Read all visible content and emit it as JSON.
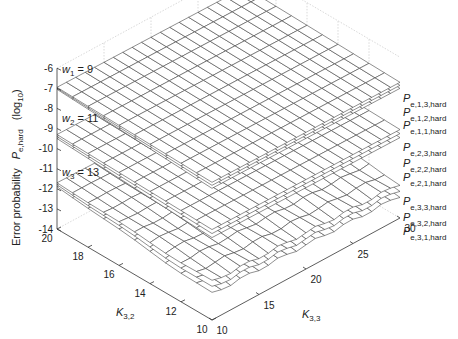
{
  "chart_data": {
    "type": "surface3d",
    "title": "",
    "xlabel": "K_{3,3}",
    "ylabel": "K_{3,2}",
    "zlabel": "Error probability P_{e,hard} (log10)",
    "zlabel_parts": {
      "main": "Error probability",
      "sym": "P",
      "sub": "e,hard",
      "unit": "(log",
      "unit_sub": "10",
      "unit_close": ")"
    },
    "x_axis": {
      "name": "K3,3",
      "range": [
        10,
        30
      ],
      "ticks": [
        10,
        15,
        20,
        25,
        30
      ]
    },
    "y_axis": {
      "name": "K3,2",
      "range": [
        10,
        20
      ],
      "ticks": [
        10,
        12,
        14,
        16,
        18,
        20
      ]
    },
    "z_axis": {
      "name": "log10 Pe,hard",
      "range": [
        -14,
        -6
      ],
      "ticks": [
        -6,
        -7,
        -8,
        -9,
        -10,
        -11,
        -12,
        -13,
        -14
      ]
    },
    "grid": false,
    "groups": [
      {
        "label": "w1 = 9",
        "w_sym": "w",
        "w_sub": "1",
        "w_val": "= 9",
        "surfaces": [
          {
            "name": "P_e,1,3,hard",
            "sub": "e,1,3,hard",
            "z_at_K32_20_K33_10": -6.95,
            "slope_K32": -0.02,
            "slope_K33": -0.005
          },
          {
            "name": "P_e,1,2,hard",
            "sub": "e,1,2,hard",
            "z_at_K32_20_K33_10": -7.0,
            "slope_K32": -0.03,
            "slope_K33": -0.005
          },
          {
            "name": "P_e,1,1,hard",
            "sub": "e,1,1,hard",
            "z_at_K32_20_K33_10": -7.05,
            "slope_K32": -0.04,
            "slope_K33": -0.005
          }
        ]
      },
      {
        "label": "w2 = 11",
        "w_sym": "w",
        "w_sub": "2",
        "w_val": "= 11",
        "surfaces": [
          {
            "name": "P_e,2,3,hard",
            "sub": "e,2,3,hard",
            "z_at_K32_20_K33_10": -9.3,
            "slope_K32": -0.02,
            "slope_K33": -0.005
          },
          {
            "name": "P_e,2,2,hard",
            "sub": "e,2,2,hard",
            "z_at_K32_20_K33_10": -9.4,
            "slope_K32": -0.03,
            "slope_K33": -0.005
          },
          {
            "name": "P_e,2,1,hard",
            "sub": "e,2,1,hard",
            "z_at_K32_20_K33_10": -9.5,
            "slope_K32": -0.04,
            "slope_K33": -0.005
          }
        ]
      },
      {
        "label": "w3 = 13",
        "w_sym": "w",
        "w_sub": "3",
        "w_val": "= 13",
        "surfaces": [
          {
            "name": "P_e,3,3,hard",
            "sub": "e,3,3,hard",
            "z_at_K32_20_K33_10": -11.7,
            "slope_K32": -0.04,
            "slope_K33": -0.01
          },
          {
            "name": "P_e,3,2,hard",
            "sub": "e,3,2,hard",
            "z_at_K32_20_K33_10": -11.8,
            "slope_K32": -0.06,
            "slope_K33": -0.01
          },
          {
            "name": "P_e,3,1,hard",
            "sub": "e,3,1,hard",
            "z_at_K32_20_K33_10": -11.9,
            "slope_K32": -0.08,
            "slope_K33": -0.01
          }
        ]
      }
    ],
    "legend_position": "right (surface end labels)"
  }
}
